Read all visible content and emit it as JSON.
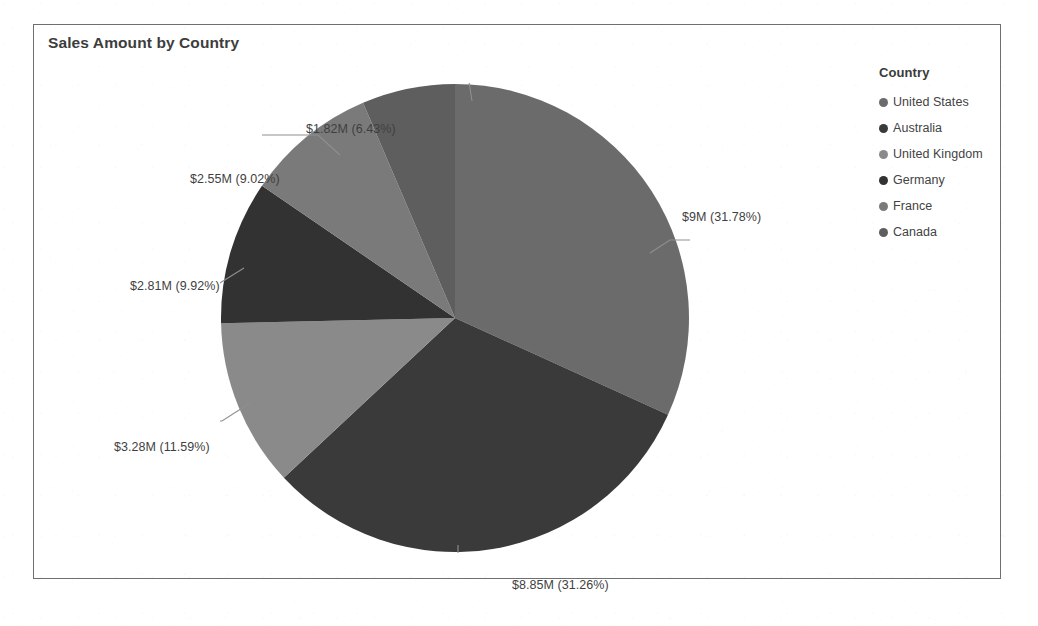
{
  "visual": {
    "title": "Sales Amount by Country"
  },
  "legend": {
    "title": "Country",
    "items": [
      {
        "label": "United States",
        "color": "#6b6b6b"
      },
      {
        "label": "Australia",
        "color": "#3a3a3a"
      },
      {
        "label": "United Kingdom",
        "color": "#8a8a8a"
      },
      {
        "label": "Germany",
        "color": "#323232"
      },
      {
        "label": "France",
        "color": "#7a7a7a"
      },
      {
        "label": "Canada",
        "color": "#5e5e5e"
      }
    ]
  },
  "labels": {
    "united_states": "$9M (31.78%)",
    "australia": "$8.85M (31.26%)",
    "united_kingdom": "$3.28M (11.59%)",
    "germany": "$2.81M (9.92%)",
    "france": "$2.55M (9.02%)",
    "canada": "$1.82M (6.43%)"
  },
  "chart_data": {
    "type": "pie",
    "title": "Sales Amount by Country",
    "legend_title": "Country",
    "legend_position": "right",
    "value_unit": "USD",
    "categories": [
      "United States",
      "Australia",
      "United Kingdom",
      "Germany",
      "France",
      "Canada"
    ],
    "values": [
      9000000,
      8850000,
      3280000,
      2810000,
      2550000,
      1820000
    ],
    "value_labels": [
      "$9M",
      "$8.85M",
      "$3.28M",
      "$2.81M",
      "$2.55M",
      "$1.82M"
    ],
    "percentages": [
      31.78,
      31.26,
      11.59,
      9.92,
      9.02,
      6.43
    ],
    "data_labels": [
      "$9M (31.78%)",
      "$8.85M (31.26%)",
      "$3.28M (11.59%)",
      "$2.81M (9.92%)",
      "$2.55M (9.02%)",
      "$1.82M (6.43%)"
    ],
    "colors": [
      "#6b6b6b",
      "#3a3a3a",
      "#8a8a8a",
      "#323232",
      "#7a7a7a",
      "#5e5e5e"
    ],
    "start_angle_deg": 0,
    "direction": "clockwise",
    "total_value": 28310000,
    "grid": false
  }
}
